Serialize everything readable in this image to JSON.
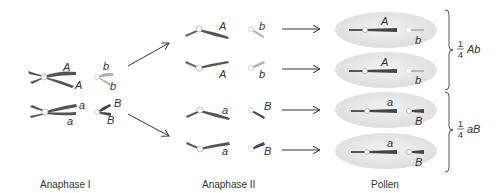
{
  "colors": {
    "dark_chromosome": "#555555",
    "light_chromosome": "#b0b0b0",
    "pollen_fill": "#e6e6e6",
    "centromere": "#ffffff",
    "arrow": "#333333",
    "text": "#333333"
  },
  "stages": {
    "anaphase1": "Anaphase I",
    "anaphase2": "Anaphase II",
    "pollen": "Pollen"
  },
  "anaphase1": {
    "top": {
      "long_upper": "A",
      "long_lower": "A",
      "short_upper": "b",
      "short_lower": "b"
    },
    "bottom": {
      "long_upper": "a",
      "long_lower": "a",
      "short_upper": "B",
      "short_lower": "B"
    }
  },
  "anaphase2": {
    "cells": [
      {
        "long": "A",
        "short": "b"
      },
      {
        "long": "A",
        "short": "b"
      },
      {
        "long": "a",
        "short": "B"
      },
      {
        "long": "a",
        "short": "B"
      }
    ]
  },
  "pollen": {
    "grains": [
      {
        "long": "A",
        "short": "b"
      },
      {
        "long": "A",
        "short": "b"
      },
      {
        "long": "a",
        "short": "B"
      },
      {
        "long": "a",
        "short": "B"
      }
    ]
  },
  "ratios": [
    {
      "numerator": "1",
      "denominator": "4",
      "genotype": "Ab"
    },
    {
      "numerator": "1",
      "denominator": "4",
      "genotype": "aB"
    }
  ]
}
